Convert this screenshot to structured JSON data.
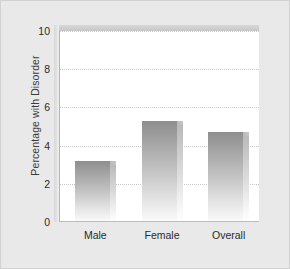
{
  "chart_data": {
    "type": "bar",
    "title": "",
    "subtitle": "",
    "xlabel": "",
    "ylabel": "Percentage with Disorder",
    "categories": [
      "Male",
      "Female",
      "Overall"
    ],
    "values": [
      3.2,
      5.3,
      4.7
    ],
    "series": [
      {
        "name": "Percentage with Disorder",
        "values": [
          3.2,
          5.3,
          4.7
        ]
      }
    ],
    "ylim": [
      0,
      10
    ],
    "xlim": [
      0,
      3
    ],
    "yticks": [
      0,
      2,
      4,
      6,
      8,
      10
    ],
    "ytick_labels": [
      "0",
      "2",
      "4",
      "6",
      "8",
      "10"
    ],
    "grid": true,
    "grid_axis": "y",
    "grid_style": "dotted",
    "legend": false,
    "legend_position": "none",
    "style": "3d-bar",
    "annotations": []
  },
  "colors": {
    "figure_background": "#e9e9e9",
    "plot_background": "#ffffff",
    "gridline": "#c9c9c9",
    "axis_line": "#b4b4b4",
    "bar_top": "#8e8e8e",
    "bar_bottom": "#fbfbfb",
    "bar_side": "#cdcdcd",
    "tick_text": "#2b2b2b",
    "axis_title_text": "#3a3a3a",
    "frame_face": "#cfcfcf"
  }
}
